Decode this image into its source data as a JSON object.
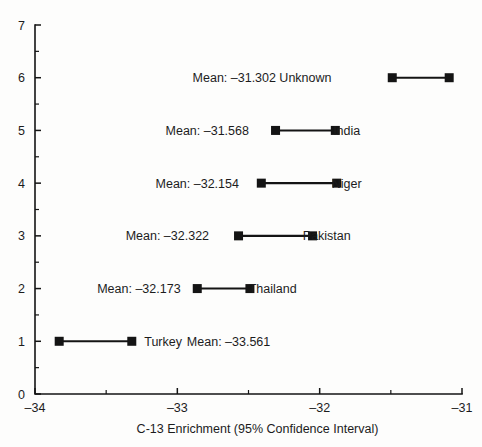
{
  "chart_data": {
    "type": "scatter",
    "title": "",
    "subtitle": "",
    "xlabel": "C-13 Enrichment (95% Confidence Interval)",
    "ylabel": "",
    "xlim": [
      -34,
      -31
    ],
    "ylim": [
      0,
      7
    ],
    "grid": false,
    "legend": null,
    "x_ticks": [
      -34,
      -33,
      -32,
      -31
    ],
    "x_tick_labels": [
      "–34",
      "–33",
      "–32",
      "–31"
    ],
    "x_minor_ticks": [
      -33.5,
      -32.5,
      -31.5
    ],
    "y_ticks": [
      0,
      1,
      2,
      3,
      4,
      5,
      6,
      7
    ],
    "y_tick_labels": [
      "0",
      "1",
      "2",
      "3",
      "4",
      "5",
      "6",
      "7"
    ],
    "y_minor_ticks": [
      0.5,
      1.5,
      2.5,
      3.5,
      4.5,
      5.5,
      6.5
    ],
    "marker_shape": "square",
    "marker_color": "#141414",
    "line_color": "#141414",
    "series": [
      {
        "name": "Unknown",
        "y": 6,
        "mean": -31.302,
        "mean_label": "Mean: –31.302",
        "group_label": "Unknown",
        "ci_low": -31.49,
        "ci_high": -31.09,
        "label_order": [
          "mean",
          "group"
        ],
        "mean_x": -32.6,
        "group_x": -32.1
      },
      {
        "name": "India",
        "y": 5,
        "mean": -31.568,
        "mean_label": "Mean: –31.568",
        "group_label": "India",
        "ci_low": -32.31,
        "ci_high": -31.89,
        "label_order": [
          "mean",
          "group"
        ],
        "mean_x": -32.79,
        "group_x": -31.81
      },
      {
        "name": "Niger",
        "y": 4,
        "mean": -32.154,
        "mean_label": "Mean: –32.154",
        "group_label": "Niger",
        "ci_low": -32.41,
        "ci_high": -31.88,
        "label_order": [
          "mean",
          "group"
        ],
        "mean_x": -32.86,
        "group_x": -31.81
      },
      {
        "name": "Pakistan",
        "y": 3,
        "mean": -32.322,
        "mean_label": "Mean: –32.322",
        "group_label": "Pakistan",
        "ci_low": -32.57,
        "ci_high": -32.05,
        "label_order": [
          "mean",
          "group"
        ],
        "mean_x": -33.07,
        "group_x": -31.95
      },
      {
        "name": "Thailand",
        "y": 2,
        "mean": -32.173,
        "mean_label": "Mean: –32.173",
        "group_label": "Thailand",
        "ci_low": -32.86,
        "ci_high": -32.49,
        "label_order": [
          "mean",
          "group"
        ],
        "mean_x": -33.27,
        "group_x": -32.33
      },
      {
        "name": "Turkey",
        "y": 1,
        "mean": -33.561,
        "mean_label": "Mean: –33.561",
        "group_label": "Turkey",
        "ci_low": -33.83,
        "ci_high": -33.32,
        "label_order": [
          "group",
          "mean"
        ],
        "group_x": -33.1,
        "mean_x": -32.64
      }
    ]
  }
}
